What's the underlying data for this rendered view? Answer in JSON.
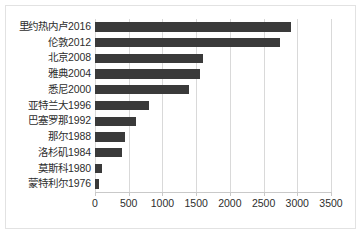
{
  "chart_data": {
    "type": "bar",
    "orientation": "horizontal",
    "title": "",
    "subtitle": "",
    "xlabel": "",
    "ylabel": "",
    "xlim": [
      0,
      3500
    ],
    "ylim": null,
    "grid": "vertical",
    "legend": null,
    "legend_position": "none",
    "bar_color": "#3a3a3a",
    "gridline_color": "#d9d9d9",
    "axis_color": "#c9c9c9",
    "background_color": "#ffffff",
    "border_color": "#e2e2e2",
    "xticks": [
      0,
      500,
      1000,
      1500,
      2000,
      2500,
      3000,
      3500
    ],
    "xtick_labels": [
      "0",
      "500",
      "1000",
      "1500",
      "2000",
      "2500",
      "3000",
      "3500"
    ],
    "categories": [
      "里约热内卢2016",
      "伦敦2012",
      "北京2008",
      "雅典2004",
      "悉尼2000",
      "亚特兰大1996",
      "巴塞罗那1992",
      "那尔1988",
      "洛杉矶1984",
      "莫斯科1980",
      "蒙特利尔1976"
    ],
    "values": [
      2900,
      2750,
      1600,
      1550,
      1400,
      800,
      610,
      450,
      400,
      100,
      55
    ]
  }
}
